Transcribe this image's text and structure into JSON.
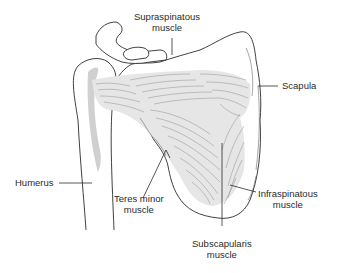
{
  "figure": {
    "colors": {
      "background": "#ffffff",
      "outline": "#2b2b2b",
      "muscle_fill": "#e6e6e6",
      "muscle_fibers": "#8e8e8e",
      "text": "#2a2a2a"
    }
  },
  "labels": {
    "supraspinatous": {
      "line1": "Supraspinatous",
      "line2": "muscle"
    },
    "scapula": {
      "line1": "Scapula"
    },
    "humerus": {
      "line1": "Humerus"
    },
    "teres_minor": {
      "line1": "Teres minor",
      "line2": "muscle"
    },
    "infraspinatous": {
      "line1": "Infraspinatous",
      "line2": "muscle"
    },
    "subscapularis": {
      "line1": "Subscapularis",
      "line2": "muscle"
    }
  }
}
